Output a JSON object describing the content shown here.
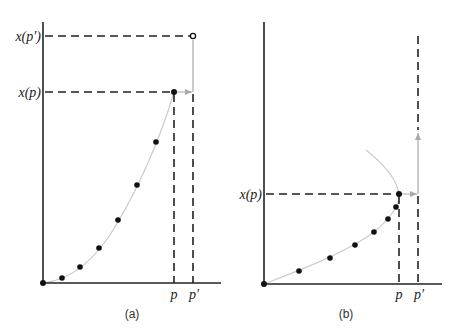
{
  "panels": {
    "a": {
      "caption": "(a)",
      "y_labels": {
        "xp_prime": "x(p′)",
        "xp": "x(p)"
      },
      "x_labels": {
        "p": "p",
        "p_prime": "p′"
      }
    },
    "b": {
      "caption": "(b)",
      "y_labels": {
        "xp": "x(p)"
      },
      "x_labels": {
        "p": "p",
        "p_prime": "p′"
      }
    }
  },
  "colors": {
    "axis": "#222222",
    "dash": "#222222",
    "curve": "#cccccc",
    "arrow": "#aaaaaa",
    "point": "#111111"
  }
}
